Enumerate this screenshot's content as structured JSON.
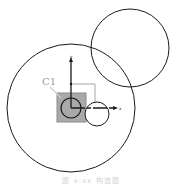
{
  "diagram": {
    "label_c1": "C1",
    "axis_x_label": "x",
    "axis_y_label": "y",
    "caption": "图 x-xx  构造图",
    "colors": {
      "stroke": "#1a1a1a",
      "square_fill": "#a9a9a9",
      "square_stroke": "#8c8c8c",
      "label": "#9a9a9a",
      "thin_line": "#8f8f8f"
    }
  }
}
